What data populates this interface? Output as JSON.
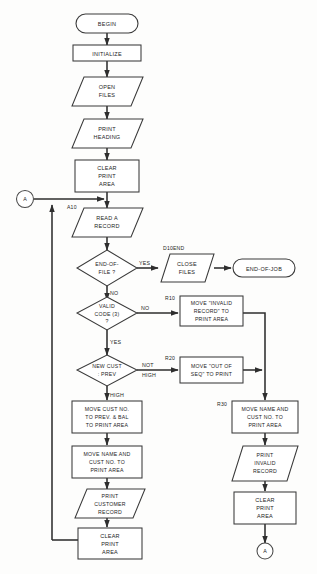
{
  "diagram": {
    "type": "program-flowchart",
    "colors": {
      "background": "#fdfdfc",
      "outline": "#3a3a3a",
      "line": "#2e2e2e",
      "text": "#1d1d1d"
    }
  },
  "nodes": {
    "begin": {
      "shape": "terminal",
      "text": "BEGIN"
    },
    "initialize": {
      "shape": "process",
      "text": "INITIALIZE"
    },
    "open_files": {
      "shape": "io",
      "line1": "OPEN",
      "line2": "FILES"
    },
    "print_heading": {
      "shape": "io",
      "line1": "PRINT",
      "line2": "HEADING"
    },
    "clear_print_area_1": {
      "shape": "process",
      "line1": "CLEAR",
      "line2": "PRINT",
      "line3": "AREA"
    },
    "read_a_record": {
      "shape": "io",
      "line1": "READ A",
      "line2": "RECORD",
      "para": "A10"
    },
    "end_of_file": {
      "shape": "decision",
      "line1": "END-OF-",
      "line2": "FILE ?"
    },
    "close_files": {
      "shape": "io",
      "line1": "CLOSE",
      "line2": "FILES",
      "para": "D10END"
    },
    "end_of_job": {
      "shape": "terminal",
      "text": "END-OF-JOB"
    },
    "valid_code": {
      "shape": "decision",
      "line1": "VALID",
      "line2": "CODE (3)",
      "line3": "?"
    },
    "move_invalid_record": {
      "shape": "process",
      "line1": "MOVE \"INVALID",
      "line2": "RECORD\" TO",
      "line3": "PRINT AREA",
      "para": "R10"
    },
    "new_cust_prev": {
      "shape": "decision",
      "line1": "NEW CUST",
      "line2": ": PREV"
    },
    "move_out_of_seq": {
      "shape": "process",
      "line1": "MOVE \"OUT OF",
      "line2": "SEQ\" TO PRINT",
      "para": "R20"
    },
    "move_cust_no_prev_bal": {
      "shape": "process",
      "line1": "MOVE CUST NO.",
      "line2": "TO PREV. & BAL",
      "line3": "TO PRINT AREA"
    },
    "move_name_cust_no_left": {
      "shape": "process",
      "line1": "MOVE NAME AND",
      "line2": "CUST NO. TO",
      "line3": "PRINT AREA"
    },
    "print_customer_record": {
      "shape": "io",
      "line1": "PRINT",
      "line2": "CUSTOMER",
      "line3": "RECORD"
    },
    "clear_print_area_left": {
      "shape": "process",
      "line1": "CLEAR",
      "line2": "PRINT",
      "line3": "AREA"
    },
    "move_name_cust_no_right": {
      "shape": "process",
      "line1": "MOVE NAME AND",
      "line2": "CUST NO. TO",
      "line3": "PRINT AREA",
      "para": "R30"
    },
    "print_invalid_record": {
      "shape": "io",
      "line1": "PRINT",
      "line2": "INVALID",
      "line3": "RECORD"
    },
    "clear_print_area_right": {
      "shape": "process",
      "line1": "CLEAR",
      "line2": "PRINT",
      "line3": "AREA"
    },
    "connector_a_left": {
      "shape": "connector",
      "text": "A"
    },
    "connector_a_bottom": {
      "shape": "connector",
      "text": "A"
    }
  },
  "branch_labels": {
    "eof_yes": "YES",
    "eof_no": "NO",
    "valid_no": "NO",
    "valid_yes": "YES",
    "cust_not": "NOT",
    "cust_high_right": "HIGH",
    "cust_high_down": "HIGH"
  },
  "paragraph_labels": {
    "a10": "A10",
    "d10end": "D10END",
    "r10": "R10",
    "r20": "R20",
    "r30": "R30"
  }
}
